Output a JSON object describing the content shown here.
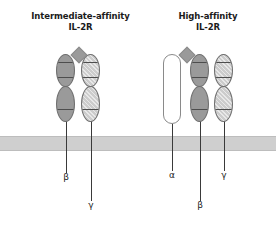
{
  "figure": {
    "type": "diagram",
    "background_color": "#ffffff",
    "width": 276,
    "height": 229
  },
  "titles": {
    "left_line1": "Intermediate-affinity",
    "left_line2": "IL-2R",
    "right_line1": "High-affinity",
    "right_line2": "IL-2R"
  },
  "membrane": {
    "name": "cell-membrane",
    "color": "#cfcfcf",
    "y": 136,
    "height": 13
  },
  "ligand": {
    "name": "il-2-ligand",
    "shape": "diamond",
    "color": "#9a9a9a"
  },
  "complexes": [
    {
      "id": "intermediate-affinity",
      "subunits": [
        {
          "chain": "beta",
          "label": "β",
          "fill": "dark",
          "shape": "two-lobe",
          "x": 66,
          "label_x": 60,
          "label_y": 172
        },
        {
          "chain": "gamma",
          "label": "γ",
          "fill": "light",
          "shape": "two-lobe",
          "x": 91,
          "label_x": 85,
          "label_y": 200
        }
      ],
      "ligand_x": 79,
      "ligand_y": 49
    },
    {
      "id": "high-affinity",
      "subunits": [
        {
          "chain": "alpha",
          "label": "α",
          "fill": "white",
          "shape": "capsule",
          "x": 172,
          "label_x": 166,
          "label_y": 170
        },
        {
          "chain": "beta",
          "label": "β",
          "fill": "dark",
          "shape": "two-lobe",
          "x": 200,
          "label_x": 194,
          "label_y": 200
        },
        {
          "chain": "gamma",
          "label": "γ",
          "fill": "light",
          "shape": "two-lobe",
          "x": 224,
          "label_x": 218,
          "label_y": 170
        }
      ],
      "ligand_x": 187,
      "ligand_y": 49
    }
  ],
  "colors": {
    "dark_subunit": "#9a9a9a",
    "light_subunit": "#cccccc",
    "alpha_subunit": "#ffffff",
    "membrane": "#cfcfcf",
    "stem": "#3a3a3a",
    "text": "#1b1b1b"
  }
}
